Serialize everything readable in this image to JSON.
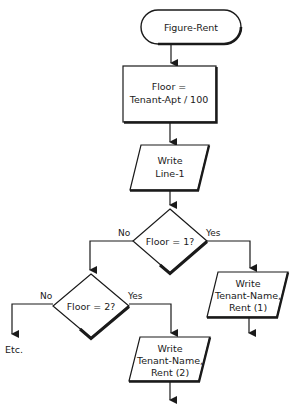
{
  "diagram": {
    "type": "flowchart",
    "nodes": {
      "start": {
        "shape": "terminator",
        "label": "Figure-Rent"
      },
      "compute_floor": {
        "shape": "process",
        "line1": "Floor =",
        "line2": "Tenant-Apt / 100"
      },
      "write_line1": {
        "shape": "io",
        "line1": "Write",
        "line2": "Line-1"
      },
      "decision1": {
        "shape": "decision",
        "label": "Floor = 1?",
        "no_label": "No",
        "yes_label": "Yes"
      },
      "write_rent1": {
        "shape": "io",
        "line1": "Write",
        "line2": "Tenant-Name,",
        "line3": "Rent (1)"
      },
      "decision2": {
        "shape": "decision",
        "label": "Floor = 2?",
        "no_label": "No",
        "yes_label": "Yes"
      },
      "write_rent2": {
        "shape": "io",
        "line1": "Write",
        "line2": "Tenant-Name,",
        "line3": "Rent (2)"
      },
      "etc": {
        "shape": "text",
        "label": "Etc."
      }
    },
    "edges": [
      {
        "from": "start",
        "to": "compute_floor"
      },
      {
        "from": "compute_floor",
        "to": "write_line1"
      },
      {
        "from": "write_line1",
        "to": "decision1"
      },
      {
        "from": "decision1",
        "to": "write_rent1",
        "label": "Yes"
      },
      {
        "from": "decision1",
        "to": "decision2",
        "label": "No"
      },
      {
        "from": "decision2",
        "to": "write_rent2",
        "label": "Yes"
      },
      {
        "from": "decision2",
        "to": "etc",
        "label": "No"
      }
    ]
  }
}
